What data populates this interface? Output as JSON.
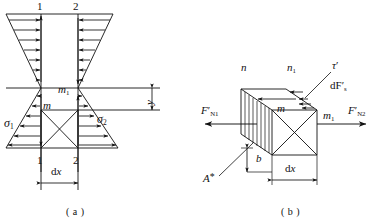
{
  "figure": {
    "background_color": "#ffffff",
    "line_color": "#111111"
  },
  "panel_a": {
    "caption": "( a )",
    "section_labels": {
      "top_left": "1",
      "top_right": "2",
      "bottom_left": "1",
      "bottom_right": "2"
    },
    "stress_labels": {
      "left": "σ",
      "left_sub": "1",
      "right": "σ",
      "right_sub": "2"
    },
    "plane_labels": {
      "m": "m",
      "m1": "m",
      "m1_sub": "1"
    },
    "dimensions": {
      "width_label": "d",
      "width_label_var": "x",
      "depth_label": "y"
    }
  },
  "panel_b": {
    "caption": "( b )",
    "corner_labels": {
      "n": "n",
      "n1": "n",
      "n1_sub": "1",
      "m": "m",
      "m1": "m",
      "m1_sub": "1"
    },
    "force_labels": {
      "left": "F",
      "left_prime": "′",
      "left_sub": "N1",
      "right": "F",
      "right_prime": "′",
      "right_sub": "N2"
    },
    "shear_labels": {
      "tau": "τ",
      "tau_prime": "′",
      "dFs": "dF",
      "dFs_prime": "′",
      "dFs_sub": "s"
    },
    "area_label": {
      "text": "A",
      "star": "*"
    },
    "dimensions": {
      "width_label": "d",
      "width_label_var": "x",
      "thickness_label": "b"
    }
  }
}
